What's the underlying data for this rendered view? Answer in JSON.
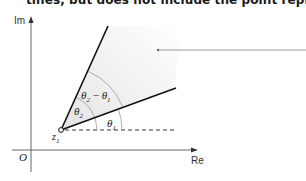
{
  "caption": {
    "partial_text": "tines, but does not include the point represen"
  },
  "axes": {
    "x_label": "Re",
    "y_label": "Im",
    "origin_label": "O"
  },
  "point": {
    "label": "z",
    "subscript": "1"
  },
  "angles": {
    "theta1": {
      "symbol": "θ",
      "sub": "1"
    },
    "theta2": {
      "symbol": "θ",
      "sub": "2"
    },
    "difference": {
      "text_a": "θ",
      "sub_a": "2",
      "op": " − ",
      "text_b": "θ",
      "sub_b": "1"
    }
  },
  "colors": {
    "shade": "#ececec",
    "axis": "#555555",
    "ray": "#111111",
    "arc": "#888888"
  }
}
